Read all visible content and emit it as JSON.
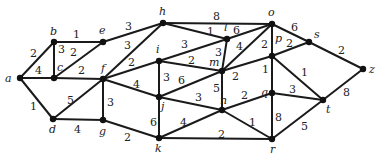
{
  "nodes": [
    {
      "id": "a",
      "x": 20,
      "y": 78,
      "lx": 5,
      "ly": 82
    },
    {
      "id": "b",
      "x": 54,
      "y": 42,
      "lx": 50,
      "ly": 35
    },
    {
      "id": "c",
      "x": 54,
      "y": 78,
      "lx": 57,
      "ly": 71
    },
    {
      "id": "d",
      "x": 53,
      "y": 119,
      "lx": 49,
      "ly": 133
    },
    {
      "id": "e",
      "x": 103,
      "y": 42,
      "lx": 99,
      "ly": 34
    },
    {
      "id": "f",
      "x": 103,
      "y": 79,
      "lx": 101,
      "ly": 72
    },
    {
      "id": "g",
      "x": 103,
      "y": 120,
      "lx": 99,
      "ly": 135
    },
    {
      "id": "h",
      "x": 163,
      "y": 23,
      "lx": 159,
      "ly": 15
    },
    {
      "id": "i",
      "x": 159,
      "y": 61,
      "lx": 156,
      "ly": 53
    },
    {
      "id": "j",
      "x": 159,
      "y": 97,
      "lx": 161,
      "ly": 110
    },
    {
      "id": "k",
      "x": 159,
      "y": 138,
      "lx": 155,
      "ly": 152
    },
    {
      "id": "l",
      "x": 227,
      "y": 39,
      "lx": 224,
      "ly": 31
    },
    {
      "id": "m",
      "x": 222,
      "y": 71,
      "lx": 209,
      "ly": 66
    },
    {
      "id": "n",
      "x": 222,
      "y": 110,
      "lx": 220,
      "ly": 104
    },
    {
      "id": "o",
      "x": 272,
      "y": 24,
      "lx": 268,
      "ly": 16
    },
    {
      "id": "p",
      "x": 272,
      "y": 56,
      "lx": 275,
      "ly": 42
    },
    {
      "id": "q",
      "x": 272,
      "y": 93,
      "lx": 261,
      "ly": 96
    },
    {
      "id": "r",
      "x": 272,
      "y": 139,
      "lx": 270,
      "ly": 153
    },
    {
      "id": "s",
      "x": 309,
      "y": 42,
      "lx": 314,
      "ly": 38
    },
    {
      "id": "t",
      "x": 323,
      "y": 100,
      "lx": 326,
      "ly": 113
    },
    {
      "id": "z",
      "x": 363,
      "y": 69,
      "lx": 369,
      "ly": 73
    }
  ],
  "edges": [
    {
      "u": "a",
      "v": "b",
      "w": "2",
      "lx": 30,
      "ly": 57
    },
    {
      "u": "a",
      "v": "c",
      "w": "4",
      "lx": 35,
      "ly": 74
    },
    {
      "u": "a",
      "v": "d",
      "w": "1",
      "lx": 30,
      "ly": 110
    },
    {
      "u": "b",
      "v": "c",
      "w": "3",
      "lx": 58,
      "ly": 53
    },
    {
      "u": "b",
      "v": "e",
      "w": "1",
      "lx": 73,
      "ly": 38
    },
    {
      "u": "c",
      "v": "e",
      "w": "2",
      "lx": 70,
      "ly": 56
    },
    {
      "u": "c",
      "v": "f",
      "w": "2",
      "lx": 78,
      "ly": 74
    },
    {
      "u": "d",
      "v": "f",
      "w": "5",
      "lx": 67,
      "ly": 104
    },
    {
      "u": "d",
      "v": "g",
      "w": "4",
      "lx": 74,
      "ly": 133
    },
    {
      "u": "e",
      "v": "h",
      "w": "3",
      "lx": 125,
      "ly": 30
    },
    {
      "u": "f",
      "v": "h",
      "w": "3",
      "lx": 124,
      "ly": 49
    },
    {
      "u": "f",
      "v": "i",
      "w": "2",
      "lx": 128,
      "ly": 66
    },
    {
      "u": "f",
      "v": "g",
      "w": "3",
      "lx": 107,
      "ly": 106
    },
    {
      "u": "f",
      "v": "j",
      "w": "4",
      "lx": 133,
      "ly": 88
    },
    {
      "u": "g",
      "v": "k",
      "w": "2",
      "lx": 124,
      "ly": 141
    },
    {
      "u": "h",
      "v": "o",
      "w": "8",
      "lx": 213,
      "ly": 20
    },
    {
      "u": "h",
      "v": "l",
      "w": "1",
      "lx": 207,
      "ly": 35
    },
    {
      "u": "i",
      "v": "l",
      "w": "3",
      "lx": 181,
      "ly": 48
    },
    {
      "u": "i",
      "v": "m",
      "w": "2",
      "lx": 188,
      "ly": 64
    },
    {
      "u": "i",
      "v": "j",
      "w": "3",
      "lx": 163,
      "ly": 81
    },
    {
      "u": "j",
      "v": "m",
      "w": "6",
      "lx": 178,
      "ly": 84
    },
    {
      "u": "j",
      "v": "n",
      "w": "3",
      "lx": 195,
      "ly": 101
    },
    {
      "u": "j",
      "v": "k",
      "w": "6",
      "lx": 150,
      "ly": 126
    },
    {
      "u": "k",
      "v": "n",
      "w": "4",
      "lx": 180,
      "ly": 126
    },
    {
      "u": "k",
      "v": "r",
      "w": "2",
      "lx": 218,
      "ly": 138
    },
    {
      "u": "l",
      "v": "m",
      "w": "3",
      "lx": 215,
      "ly": 56
    },
    {
      "u": "l",
      "v": "o",
      "w": "6",
      "lx": 233,
      "ly": 34
    },
    {
      "u": "m",
      "v": "o",
      "w": "4",
      "lx": 236,
      "ly": 50
    },
    {
      "u": "m",
      "v": "p",
      "w": "2",
      "lx": 232,
      "ly": 80
    },
    {
      "u": "m",
      "v": "n",
      "w": "5",
      "lx": 213,
      "ly": 92
    },
    {
      "u": "n",
      "v": "q",
      "w": "2",
      "lx": 241,
      "ly": 99
    },
    {
      "u": "n",
      "v": "r",
      "w": "1",
      "lx": 249,
      "ly": 126
    },
    {
      "u": "o",
      "v": "p",
      "w": "2",
      "lx": 261,
      "ly": 48
    },
    {
      "u": "o",
      "v": "s",
      "w": "6",
      "lx": 291,
      "ly": 31
    },
    {
      "u": "p",
      "v": "s",
      "w": "2",
      "lx": 286,
      "ly": 47
    },
    {
      "u": "p",
      "v": "q",
      "w": "1",
      "lx": 262,
      "ly": 73
    },
    {
      "u": "p",
      "v": "t",
      "w": "1",
      "lx": 301,
      "ly": 76
    },
    {
      "u": "q",
      "v": "t",
      "w": "3",
      "lx": 289,
      "ly": 93
    },
    {
      "u": "q",
      "v": "r",
      "w": "8",
      "lx": 275,
      "ly": 121
    },
    {
      "u": "r",
      "v": "t",
      "w": "5",
      "lx": 301,
      "ly": 130
    },
    {
      "u": "s",
      "v": "z",
      "w": "2",
      "lx": 338,
      "ly": 54
    },
    {
      "u": "t",
      "v": "z",
      "w": "8",
      "lx": 343,
      "ly": 96
    }
  ]
}
